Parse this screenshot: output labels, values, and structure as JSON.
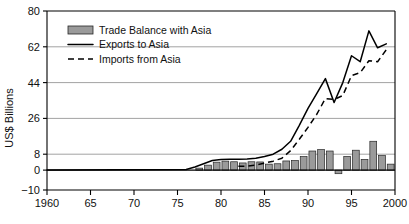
{
  "chart_data": {
    "type": "bar",
    "title": "",
    "xlabel": "",
    "ylabel": "US$ Billions",
    "xlim": [
      1960,
      2000
    ],
    "ylim": [
      -10,
      80
    ],
    "grid": true,
    "legend_position": "top-left",
    "yticks": [
      -10,
      0,
      8,
      26,
      44,
      62,
      80
    ],
    "ytick_labels": [
      "−10",
      "0",
      "8",
      "26",
      "44",
      "62",
      "80"
    ],
    "gridline_values": [
      8,
      26,
      44,
      62
    ],
    "xticks": [
      1960,
      1965,
      1970,
      1975,
      1980,
      1985,
      1990,
      1995,
      2000
    ],
    "xtick_labels": [
      "1960",
      "65",
      "70",
      "75",
      "80",
      "85",
      "90",
      "95",
      "2000"
    ],
    "legend": [
      {
        "label": "Trade Balance with Asia",
        "marker": "bar-swatch"
      },
      {
        "label": "Exports to Asia",
        "marker": "solid-line"
      },
      {
        "label": "Imports from Asia",
        "marker": "dashed-line"
      }
    ],
    "categories": [
      1977,
      1978,
      1979,
      1980,
      1981,
      1982,
      1983,
      1984,
      1985,
      1986,
      1987,
      1988,
      1989,
      1990,
      1991,
      1992,
      1993,
      1994,
      1995,
      1996,
      1997,
      1998,
      1999
    ],
    "series": [
      {
        "name": "Trade Balance with Asia",
        "type": "bar",
        "values": [
          1.0,
          2.5,
          4.0,
          4.5,
          4.2,
          3.6,
          4.2,
          4.1,
          3.0,
          3.2,
          4.6,
          4.8,
          6.8,
          9.6,
          10.3,
          9.6,
          -1.8,
          6.9,
          10.0,
          5.4,
          14.5,
          7.3,
          3.0
        ]
      },
      {
        "name": "Exports to Asia",
        "type": "line",
        "style": "solid",
        "x": [
          1960,
          1976,
          1977,
          1978,
          1979,
          1980,
          1981,
          1982,
          1983,
          1984,
          1985,
          1986,
          1987,
          1988,
          1989,
          1990,
          1991,
          1992,
          1993,
          1994,
          1995,
          1996,
          1997,
          1998,
          1999
        ],
        "values": [
          0.1,
          0.3,
          1.6,
          3.2,
          4.8,
          5.3,
          5.4,
          5.4,
          5.6,
          6.0,
          6.8,
          8.0,
          10.5,
          14.5,
          22.5,
          31.0,
          38.5,
          46.0,
          34.0,
          44.0,
          57.5,
          54.5,
          70.0,
          61.5,
          63.5
        ]
      },
      {
        "name": "Imports from Asia",
        "type": "line",
        "style": "dashed",
        "x": [
          1982,
          1983,
          1984,
          1985,
          1986,
          1987,
          1988,
          1989,
          1990,
          1991,
          1992,
          1993,
          1994,
          1995,
          1996,
          1997,
          1998,
          1999
        ],
        "values": [
          1.9,
          2.0,
          2.5,
          3.5,
          4.5,
          6.0,
          9.8,
          15.5,
          21.5,
          28.0,
          36.0,
          35.5,
          37.5,
          47.5,
          49.0,
          55.0,
          54.5,
          60.5
        ]
      }
    ]
  }
}
